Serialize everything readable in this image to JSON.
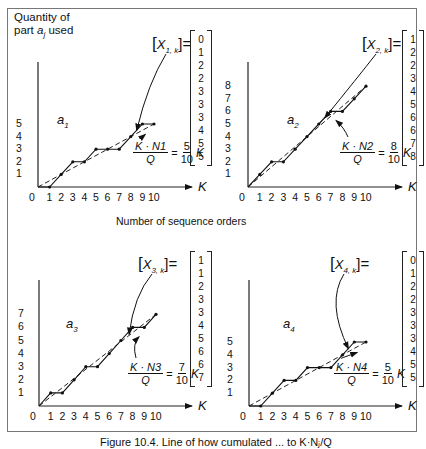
{
  "figure": {
    "y_axis_label_line1": "Quantity of",
    "y_axis_label_line2_prefix": "part ",
    "y_axis_label_var": "a",
    "y_axis_label_sub": "j",
    "y_axis_label_line2_suffix": " used",
    "x_axis_caption": "Number of sequence orders",
    "caption": "Figure 10.4. Line of how cumulated ... to K·Nⱼ/Q",
    "axis_variable": "K"
  },
  "chart_data": [
    {
      "type": "line",
      "title": "a1",
      "part": "a",
      "part_index": "1",
      "xlabel": "K",
      "ylabel": "Quantity of part a_j used",
      "x": [
        0,
        1,
        2,
        3,
        4,
        5,
        6,
        7,
        8,
        9,
        10
      ],
      "x_ticks": [
        "0",
        "1",
        "2",
        "3",
        "4",
        "5",
        "6",
        "7",
        "8",
        "9",
        "10"
      ],
      "y_ticks": [
        "1",
        "2",
        "3",
        "4",
        "5"
      ],
      "series": [
        {
          "name": "X_1,k (actual, step)",
          "values": [
            0,
            0,
            1,
            2,
            2,
            3,
            3,
            3,
            4,
            5,
            5
          ]
        },
        {
          "name": "K·N_1/Q (ideal, dashed)",
          "values": [
            0,
            0.5,
            1,
            1.5,
            2,
            2.5,
            3,
            3.5,
            4,
            4.5,
            5
          ]
        }
      ],
      "vector_label": "[X1,k]=",
      "vector": [
        "0",
        "1",
        "2",
        "2",
        "3",
        "3",
        "3",
        "4",
        "5",
        "5"
      ],
      "formula": {
        "num": "K · N1",
        "den": "Q",
        "eq": "=",
        "coef_num": "5",
        "coef_den": "10",
        "var": "K"
      },
      "ylim": [
        0,
        5
      ]
    },
    {
      "type": "line",
      "title": "a2",
      "part": "a",
      "part_index": "2",
      "xlabel": "K",
      "x": [
        0,
        1,
        2,
        3,
        4,
        5,
        6,
        7,
        8,
        9,
        10
      ],
      "x_ticks": [
        "0",
        "1",
        "2",
        "3",
        "4",
        "5",
        "6",
        "7",
        "8",
        "9",
        "10"
      ],
      "y_ticks": [
        "1",
        "2",
        "3",
        "4",
        "5",
        "6",
        "7",
        "8"
      ],
      "series": [
        {
          "name": "X_2,k (actual, step)",
          "values": [
            0,
            1,
            2,
            2,
            3,
            4,
            5,
            6,
            6,
            7,
            8
          ]
        },
        {
          "name": "K·N_2/Q (ideal, dashed)",
          "values": [
            0,
            0.8,
            1.6,
            2.4,
            3.2,
            4,
            4.8,
            5.6,
            6.4,
            7.2,
            8
          ]
        }
      ],
      "vector_label": "[X2,k]=",
      "vector": [
        "1",
        "2",
        "2",
        "3",
        "4",
        "5",
        "6",
        "6",
        "7",
        "8"
      ],
      "formula": {
        "num": "K · N2",
        "den": "Q",
        "eq": "=",
        "coef_num": "8",
        "coef_den": "10",
        "var": "K"
      },
      "ylim": [
        0,
        8
      ]
    },
    {
      "type": "line",
      "title": "a3",
      "part": "a",
      "part_index": "3",
      "xlabel": "K",
      "x": [
        0,
        1,
        2,
        3,
        4,
        5,
        6,
        7,
        8,
        9,
        10
      ],
      "x_ticks": [
        "0",
        "1",
        "2",
        "3",
        "4",
        "5",
        "6",
        "7",
        "8",
        "9",
        "10"
      ],
      "y_ticks": [
        "1",
        "2",
        "3",
        "4",
        "5",
        "6",
        "7"
      ],
      "series": [
        {
          "name": "X_3,k (actual, step)",
          "values": [
            0,
            1,
            1,
            2,
            3,
            3,
            4,
            5,
            6,
            6,
            7
          ]
        },
        {
          "name": "K·N_3/Q (ideal, dashed)",
          "values": [
            0,
            0.7,
            1.4,
            2.1,
            2.8,
            3.5,
            4.2,
            4.9,
            5.6,
            6.3,
            7
          ]
        }
      ],
      "vector_label": "[X3,k]=",
      "vector": [
        "1",
        "1",
        "2",
        "3",
        "3",
        "4",
        "5",
        "6",
        "6",
        "7"
      ],
      "formula": {
        "num": "K · N3",
        "den": "Q",
        "eq": "=",
        "coef_num": "7",
        "coef_den": "10",
        "var": "K"
      },
      "ylim": [
        0,
        7
      ]
    },
    {
      "type": "line",
      "title": "a4",
      "part": "a",
      "part_index": "4",
      "xlabel": "K",
      "x": [
        0,
        1,
        2,
        3,
        4,
        5,
        6,
        7,
        8,
        9,
        10
      ],
      "x_ticks": [
        "0",
        "1",
        "2",
        "3",
        "4",
        "5",
        "6",
        "7",
        "8",
        "9",
        "10"
      ],
      "y_ticks": [
        "1",
        "2",
        "3",
        "4",
        "5"
      ],
      "series": [
        {
          "name": "X_4,k (actual, step)",
          "values": [
            0,
            0,
            1,
            2,
            2,
            3,
            3,
            3,
            4,
            5,
            5
          ]
        },
        {
          "name": "K·N_4/Q (ideal, dashed)",
          "values": [
            0,
            0.5,
            1,
            1.5,
            2,
            2.5,
            3,
            3.5,
            4,
            4.5,
            5
          ]
        }
      ],
      "vector_label": "[X4,k]=",
      "vector": [
        "0",
        "1",
        "2",
        "2",
        "3",
        "3",
        "3",
        "4",
        "5",
        "5"
      ],
      "formula": {
        "num": "K · N4",
        "den": "Q",
        "eq": "=",
        "coef_num": "5",
        "coef_den": "10",
        "var": "K"
      },
      "ylim": [
        0,
        5
      ]
    }
  ]
}
